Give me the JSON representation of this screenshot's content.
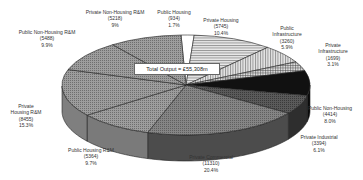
{
  "chart_data": {
    "type": "pie",
    "style": "3d-exploded-greyscale",
    "title": "",
    "center_label": "Total Output = £55,308m",
    "total": 55308,
    "unit": "£m",
    "slices": [
      {
        "name": "Public Housing",
        "value": 934,
        "percent": "1.7%",
        "fill": "#ffffff"
      },
      {
        "name": "Private Housing",
        "value": 5745,
        "percent": "10.4%",
        "fill": "#bbbbbb"
      },
      {
        "name": "Public Infrastructure",
        "value": 3260,
        "percent": "5.9%",
        "fill": "#d2d2d2"
      },
      {
        "name": "Private Infrastructure",
        "value": 1699,
        "percent": "3.1%",
        "fill": "#c4c4c4"
      },
      {
        "name": "Public Non-Housing",
        "value": 4414,
        "percent": "8.0%",
        "fill": "#151515"
      },
      {
        "name": "Private Industrial",
        "value": 3394,
        "percent": "6.1%",
        "fill": "#3a3a3a"
      },
      {
        "name": "Private Commercial",
        "value": 11310,
        "percent": "20.4%",
        "fill": "#5f5f5f"
      },
      {
        "name": "Public Housing R&M",
        "value": 5364,
        "percent": "9.7%",
        "fill": "#8a8a8a"
      },
      {
        "name": "Private Housing R&M",
        "value": 8455,
        "percent": "15.3%",
        "fill": "#9a9a9a"
      },
      {
        "name": "Public Non-Housing R&M",
        "value": 5488,
        "percent": "9.9%",
        "fill": "#a6a6a6"
      },
      {
        "name": "Private Non-Housing R&M",
        "value": 5218,
        "percent": "9%",
        "fill": "#959595"
      }
    ]
  },
  "labels": [
    {
      "l1": "Private Non-Housing R&M",
      "l2": "(5218)",
      "l3": "9%",
      "x": 115,
      "y": 9
    },
    {
      "l1": "Public Housing",
      "l2": "(934)",
      "l3": "1.7%",
      "x": 174,
      "y": 9
    },
    {
      "l1": "Private Housing",
      "l2": "(5745)",
      "l3": "10.4%",
      "x": 221,
      "y": 17
    },
    {
      "l1": "Public",
      "l2": "Infrastructure",
      "l3": "(3260)",
      "l4": "5.9%",
      "x": 287,
      "y": 25
    },
    {
      "l1": "Private",
      "l2": "Infrastructure",
      "l3": "(1699)",
      "l4": "3.1%",
      "x": 333,
      "y": 42
    },
    {
      "l1": "Public Non-Housing",
      "l2": "(4414)",
      "l3": "8.0%",
      "x": 330,
      "y": 105
    },
    {
      "l1": "Private Industrial",
      "l2": "(3394)",
      "l3": "6.1%",
      "x": 319,
      "y": 134
    },
    {
      "l1": "Private Commercial",
      "l2": "(11310)",
      "l3": "20.4%",
      "x": 211,
      "y": 154
    },
    {
      "l1": "Public Housing R&M",
      "l2": "(5364)",
      "l3": "9.7%",
      "x": 91,
      "y": 147
    },
    {
      "l1": "Private",
      "l2": "Housing R&M",
      "l3": "(8455)",
      "l4": "15.3%",
      "x": 26,
      "y": 103
    },
    {
      "l1": "Public Non-Housing R&M",
      "l2": "(5488)",
      "l3": "9.9%",
      "x": 47,
      "y": 29
    }
  ]
}
